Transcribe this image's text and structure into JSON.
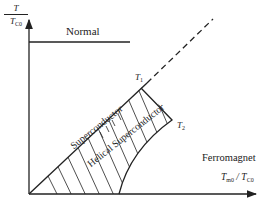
{
  "diagram": {
    "type": "phase-diagram",
    "y_axis": {
      "numerator": "T",
      "denominator": "T",
      "denominator_sub": "C0"
    },
    "x_axis": {
      "numerator": "T",
      "numerator_sub": "m0",
      "denominator": "T",
      "denominator_sub": "C0"
    },
    "regions": {
      "normal": "Normal",
      "superconductor": "Superconductor",
      "helical_superconductor": "Helical Superconductor",
      "ferromagnet": "Ferromagnet"
    },
    "points": {
      "t1": {
        "symbol": "T",
        "sub": "1"
      },
      "t2": {
        "symbol": "T",
        "sub": "2"
      }
    },
    "colors": {
      "line": "#222222",
      "background": "#ffffff"
    }
  }
}
